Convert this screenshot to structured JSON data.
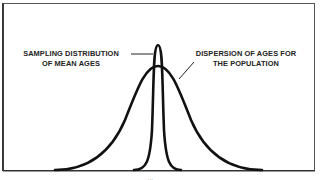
{
  "diagram": {
    "type": "overlapping normal distributions",
    "labels": {
      "sampling_line1": "SAMPLING DISTRIBUTION",
      "sampling_line2": "OF MEAN AGES",
      "population_line1": "DISPERSION OF AGES FOR",
      "population_line2": "THE POPULATION"
    },
    "curves": [
      {
        "name": "Sampling distribution of mean ages",
        "shape": "narrow, tall bell curve",
        "center_x": 158,
        "peak_y": 45
      },
      {
        "name": "Dispersion of ages for the population",
        "shape": "wide bell curve",
        "center_x": 158,
        "peak_y": 66
      }
    ],
    "page_number": "..."
  }
}
